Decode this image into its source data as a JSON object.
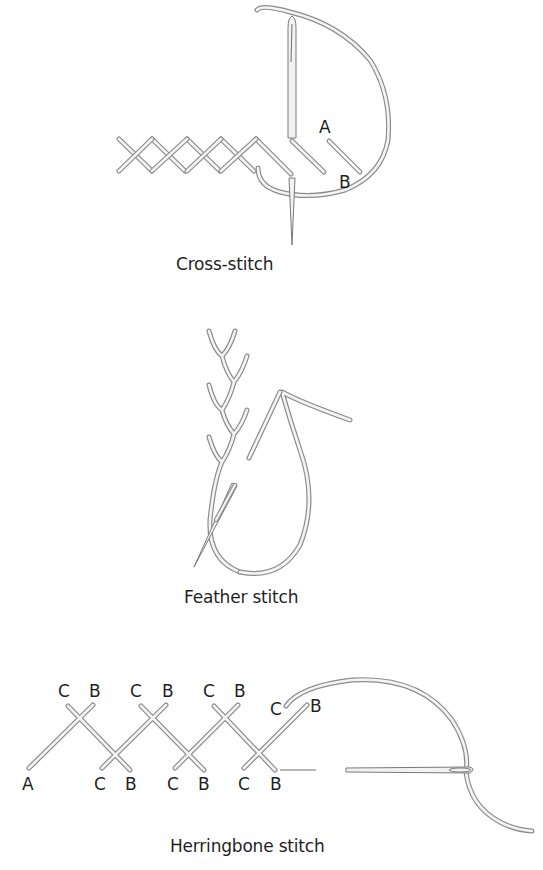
{
  "figures": [
    {
      "id": "cross-stitch",
      "caption": "Cross-stitch",
      "labels": [
        "A",
        "B"
      ]
    },
    {
      "id": "feather-stitch",
      "caption": "Feather stitch",
      "labels": []
    },
    {
      "id": "herringbone-stitch",
      "caption": "Herringbone stitch",
      "labels": {
        "top": [
          "C",
          "B",
          "C",
          "B",
          "C",
          "B",
          "C",
          "B"
        ],
        "bottom": [
          "A",
          "C",
          "B",
          "C",
          "B",
          "C",
          "B"
        ]
      }
    }
  ],
  "colors": {
    "thread_outline": "#8c8c8c",
    "thread_fill": "#f4f4f4",
    "text": "#1f1f1f",
    "background": "#ffffff"
  }
}
